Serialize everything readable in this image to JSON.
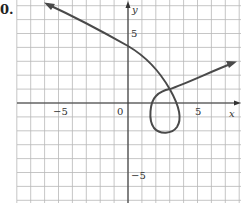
{
  "problem": {
    "number_label": "0."
  },
  "axes": {
    "x_label": "x",
    "y_label": "y",
    "x_ticks": [
      {
        "value": -5,
        "label": "−5"
      },
      {
        "value": 0,
        "label": "0"
      },
      {
        "value": 5,
        "label": "5"
      }
    ],
    "y_ticks": [
      {
        "value": 5,
        "label": "5"
      },
      {
        "value": -5,
        "label": "−5"
      }
    ]
  },
  "chart_data": {
    "type": "line",
    "title": "",
    "xlabel": "x",
    "ylabel": "y",
    "xlim": [
      -8,
      8
    ],
    "ylim": [
      -7,
      7.4
    ],
    "grid": true,
    "grid_spacing": 1,
    "legend": null,
    "series": [
      {
        "name": "parametric curve (self-intersecting loop)",
        "arrows": "both ends",
        "points": [
          {
            "x": -5.9,
            "y": 7.1
          },
          {
            "x": -3.0,
            "y": 5.8
          },
          {
            "x": 0.0,
            "y": 4.1
          },
          {
            "x": 2.0,
            "y": 2.3
          },
          {
            "x": 3.0,
            "y": 1.0
          },
          {
            "x": 3.6,
            "y": -0.5
          },
          {
            "x": 3.4,
            "y": -1.6
          },
          {
            "x": 2.5,
            "y": -2.1
          },
          {
            "x": 1.7,
            "y": -1.3
          },
          {
            "x": 1.9,
            "y": 0.0
          },
          {
            "x": 3.0,
            "y": 1.0
          },
          {
            "x": 5.0,
            "y": 1.9
          },
          {
            "x": 7.8,
            "y": 2.9
          }
        ]
      }
    ],
    "annotations": [
      {
        "text": "self-intersection",
        "x": 3.0,
        "y": 1.0
      }
    ]
  }
}
